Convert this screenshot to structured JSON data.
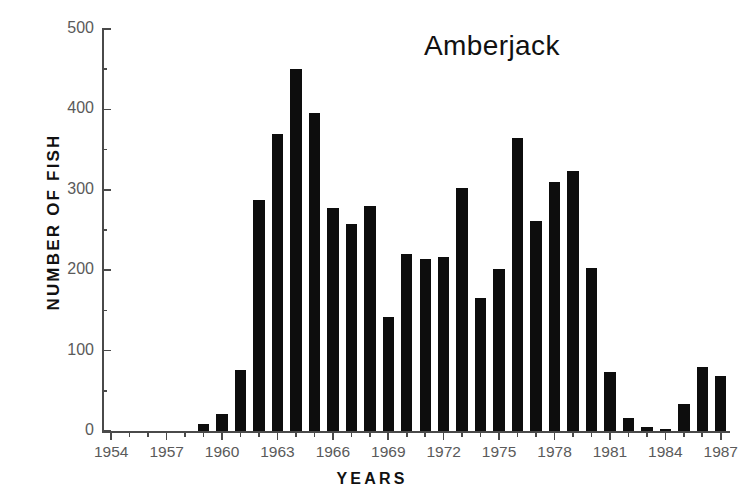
{
  "chart_data": {
    "type": "bar",
    "title": "Amberjack",
    "xlabel": "YEARS",
    "ylabel": "NUMBER OF FISH",
    "ylim": [
      0,
      500
    ],
    "ytick_labels": [
      "0",
      "100",
      "200",
      "300",
      "400",
      "500"
    ],
    "ytick_values": [
      0,
      100,
      200,
      300,
      400,
      500
    ],
    "xlim": [
      1953.5,
      1987.5
    ],
    "xtick_labels": [
      "1954",
      "1957",
      "1960",
      "1963",
      "1966",
      "1969",
      "1972",
      "1975",
      "1978",
      "1981",
      "1984",
      "1987"
    ],
    "xtick_values": [
      1954,
      1957,
      1960,
      1963,
      1966,
      1969,
      1972,
      1975,
      1978,
      1981,
      1984,
      1987
    ],
    "grid": false,
    "legend": false,
    "bar_color": "#0d0d0d",
    "categories": [
      1954,
      1955,
      1956,
      1957,
      1958,
      1959,
      1960,
      1961,
      1962,
      1963,
      1964,
      1965,
      1966,
      1967,
      1968,
      1969,
      1970,
      1971,
      1972,
      1973,
      1974,
      1975,
      1976,
      1977,
      1978,
      1979,
      1980,
      1981,
      1982,
      1983,
      1984,
      1985,
      1986,
      1987
    ],
    "values": [
      0,
      0,
      0,
      0,
      0,
      9,
      21,
      76,
      287,
      370,
      450,
      396,
      278,
      258,
      280,
      142,
      220,
      214,
      217,
      302,
      165,
      202,
      364,
      261,
      310,
      324,
      203,
      74,
      16,
      5,
      3,
      33,
      80,
      68
    ]
  },
  "axes": {
    "title": "Amberjack",
    "ylabel": "NUMBER OF FISH",
    "xlabel": "YEARS"
  }
}
